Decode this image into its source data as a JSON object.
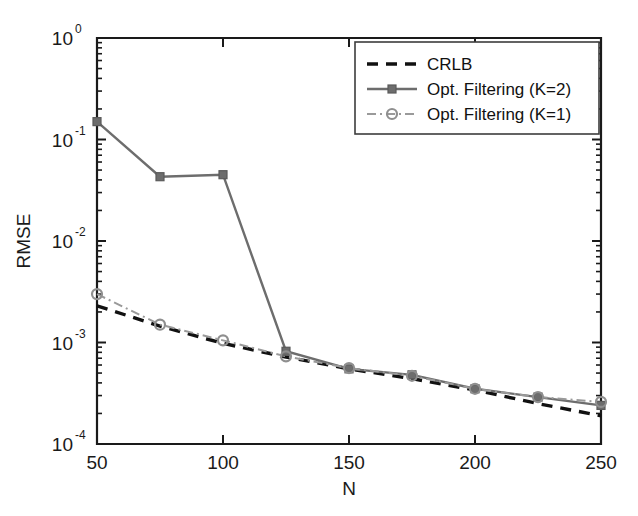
{
  "chart_data": {
    "type": "line",
    "title": "",
    "xlabel": "N",
    "ylabel": "RMSE",
    "xscale": "linear",
    "yscale": "log",
    "xlim": [
      50,
      250
    ],
    "ylim": [
      0.0001,
      1
    ],
    "grid": false,
    "legend_position": "top-right",
    "x_ticks": [
      50,
      100,
      150,
      200,
      250
    ],
    "x_ticklabels": [
      "50",
      "100",
      "150",
      "200",
      "250"
    ],
    "y_ticks": [
      1,
      0.1,
      0.01,
      0.001,
      0.0001
    ],
    "y_ticklabels": [
      "10^0",
      "10^-1",
      "10^-2",
      "10^-3",
      "10^-4"
    ],
    "y_tick_mantissa": "10",
    "y_tick_exponents": [
      "0",
      "-1",
      "-2",
      "-3",
      "-4"
    ],
    "series": [
      {
        "name": "CRLB",
        "color": "#111111",
        "style": "dashed",
        "marker": "none",
        "x": [
          50,
          75,
          100,
          125,
          150,
          175,
          200,
          225,
          250
        ],
        "values": [
          0.0023,
          0.00145,
          0.00098,
          0.00072,
          0.00055,
          0.00044,
          0.00034,
          0.00025,
          0.00019
        ]
      },
      {
        "name": "Opt. Filtering (K=2)",
        "color": "#6d6d6d",
        "style": "solid",
        "marker": "square",
        "x": [
          50,
          75,
          100,
          125,
          150,
          175,
          200,
          225,
          250
        ],
        "values": [
          0.15,
          0.043,
          0.045,
          0.00082,
          0.00055,
          0.00048,
          0.00035,
          0.00029,
          0.00024
        ]
      },
      {
        "name": "Opt. Filtering (K=1)",
        "color": "#9a9a9a",
        "style": "dashdot",
        "marker": "circle",
        "x": [
          50,
          75,
          100,
          125,
          150,
          175,
          200,
          225,
          250
        ],
        "values": [
          0.003,
          0.0015,
          0.00105,
          0.00073,
          0.00056,
          0.00047,
          0.00035,
          0.00029,
          0.00026
        ]
      }
    ]
  },
  "legend": {
    "entries": [
      {
        "label": "CRLB"
      },
      {
        "label": "Opt. Filtering (K=2)"
      },
      {
        "label": "Opt. Filtering (K=1)"
      }
    ]
  },
  "axes": {
    "x_title": "N",
    "y_title": "RMSE"
  },
  "colors": {
    "axis": "#1a1a1a",
    "background": "#ffffff",
    "crlb": "#111111",
    "k2": "#6d6d6d",
    "k1": "#9a9a9a"
  }
}
